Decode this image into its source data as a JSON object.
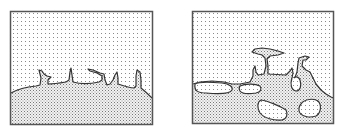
{
  "figure": {
    "panels": [
      {
        "id": "left",
        "label": "",
        "description": "Interface between lightly dotted upper phase and denser dotted lower phase with finger-like protrusions"
      },
      {
        "id": "right",
        "label": "",
        "description": "Later stage with detached bubbles/droplets of upper phase trapped in lower phase and a T-shaped protrusion"
      }
    ],
    "colors": {
      "background": "#ffffff",
      "frame": "#555555",
      "interface_line": "#333333",
      "upper_dots": "#8a8a8a",
      "lower_pattern": "#777777"
    }
  }
}
